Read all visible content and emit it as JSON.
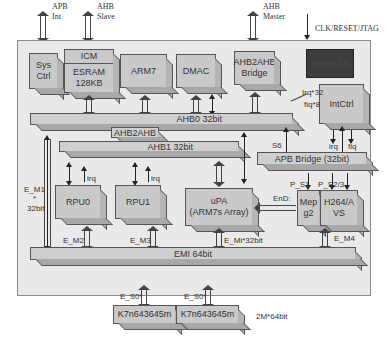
{
  "external_ports": {
    "apb_int": [
      "APB",
      "Int"
    ],
    "ahb_slave": [
      "AHB",
      "Slave"
    ],
    "ahb_master": [
      "AHB",
      "Master"
    ],
    "clk_reset_jtag": "CLK/RESET/JTAG"
  },
  "blocks": {
    "sys_ctrl": [
      "Sys",
      "Ctrl"
    ],
    "icm": "ICM",
    "esram": [
      "ESRAM",
      "128KB"
    ],
    "arm7": "ARM7",
    "dmac": "DMAC",
    "ahb2ahb_bridge": [
      "AHB2AHB",
      "Bridge"
    ],
    "kernel": "Kernel 2.0",
    "intctrl": "IntCtrl",
    "rpu0": "RPU0",
    "rpu1": "RPU1",
    "upa": [
      "uPA",
      "(ARM7s Array)"
    ],
    "mpeg2": [
      "Mep",
      "g2"
    ],
    "h264": [
      "H264/A",
      "VS"
    ],
    "sdram0": "K7n643645m",
    "sdram1": "K7n643645m"
  },
  "buses": {
    "ahb0": "AHB0 32bit",
    "ahb2ahb": "AHB2AHB",
    "ahb1": "AHB1 32bit",
    "apb_bridge": "APB Bridge (32bit)",
    "emi": "EMI 64bit"
  },
  "signals": {
    "irq32": "Irq*32",
    "fiq8": "fiq*8",
    "irq": "irq",
    "fiq": "fiq",
    "s6": "S6",
    "p_s0": "P_S0",
    "p_s1": "P_S1",
    "p_s23": "P_S2/3",
    "end": "EnD:",
    "e_m1": "E_M1",
    "e_m1_star": "*",
    "e_m1_width": "32bit",
    "e_m2": "E_M2",
    "e_m3": "E_M3",
    "e_mi": "E_Mi*32bit",
    "e_m4": "E_M4",
    "e_s0_a": "E_S0*",
    "e_s0_b": "E_S0*",
    "rpu_irq_0": "irq",
    "rpu_irq_1": "irq",
    "memory_size": "2M*64bit"
  }
}
